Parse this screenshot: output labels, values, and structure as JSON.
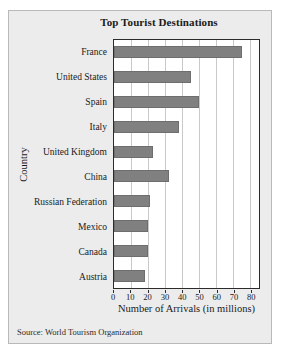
{
  "figure": {
    "source_note": "Source: World Tourism Organization"
  },
  "chart_data": {
    "type": "bar",
    "orientation": "horizontal",
    "title": "Top Tourist Destinations",
    "xlabel": "Number of Arrivals (in millions)",
    "ylabel": "Country",
    "categories": [
      "France",
      "United States",
      "Spain",
      "Italy",
      "United Kingdom",
      "China",
      "Russian Federation",
      "Mexico",
      "Canada",
      "Austria"
    ],
    "values": [
      75,
      45,
      50,
      38,
      23,
      32,
      21,
      20,
      20,
      18
    ],
    "xticks": [
      0,
      10,
      20,
      30,
      40,
      50,
      60,
      70,
      80
    ],
    "xlim": [
      0,
      85
    ],
    "grid": "vertical",
    "legend": "none",
    "bar_color": "#808080",
    "plot_background": "#ffffff",
    "figure_background": "#ececec"
  }
}
